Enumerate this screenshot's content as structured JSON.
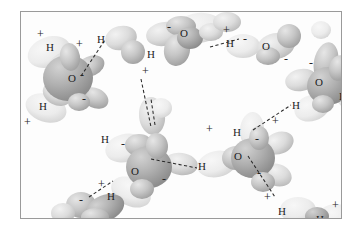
{
  "figure": {
    "kind": "molecular-illustration",
    "background_color": "#ffffff",
    "panel_color": "#fdfdfd",
    "frame_color": "#9a9a9a",
    "lobe_fill_light": "#e3e3e3",
    "lobe_fill_mid": "#c9c9c9",
    "lobe_fill_dark": "#a9a9a9",
    "label_color": "#1d1d1d",
    "bond_color": "#2b2b2b"
  },
  "labels": {
    "atoms": [
      {
        "text": "H",
        "x": 45,
        "y": 41
      },
      {
        "text": "H",
        "x": 96,
        "y": 33
      },
      {
        "text": "O",
        "x": 67,
        "y": 72
      },
      {
        "text": "H",
        "x": 38,
        "y": 100
      },
      {
        "text": "O",
        "x": 179,
        "y": 27
      },
      {
        "text": "H",
        "x": 146,
        "y": 48
      },
      {
        "text": "H",
        "x": 225,
        "y": 37
      },
      {
        "text": "O",
        "x": 261,
        "y": 40
      },
      {
        "text": "O",
        "x": 314,
        "y": 76
      },
      {
        "text": "H",
        "x": 338,
        "y": 90
      },
      {
        "text": "H",
        "x": 291,
        "y": 99
      },
      {
        "text": "H",
        "x": 100,
        "y": 133
      },
      {
        "text": "O",
        "x": 130,
        "y": 165
      },
      {
        "text": "H",
        "x": 232,
        "y": 126
      },
      {
        "text": "O",
        "x": 233,
        "y": 150
      },
      {
        "text": "H",
        "x": 197,
        "y": 160
      },
      {
        "text": "H",
        "x": 106,
        "y": 190
      },
      {
        "text": "H",
        "x": 277,
        "y": 205
      },
      {
        "text": "H",
        "x": 315,
        "y": 213
      }
    ],
    "charges": [
      {
        "sign": "+",
        "x": 36,
        "y": 27
      },
      {
        "sign": "+",
        "x": 75,
        "y": 37
      },
      {
        "sign": "-",
        "x": 79,
        "y": 68
      },
      {
        "sign": "-",
        "x": 81,
        "y": 92
      },
      {
        "sign": "+",
        "x": 23,
        "y": 115
      },
      {
        "sign": "-",
        "x": 166,
        "y": 20
      },
      {
        "sign": "+",
        "x": 141,
        "y": 64
      },
      {
        "sign": "+",
        "x": 222,
        "y": 23
      },
      {
        "sign": "-",
        "x": 242,
        "y": 32
      },
      {
        "sign": "-",
        "x": 283,
        "y": 52
      },
      {
        "sign": "-",
        "x": 308,
        "y": 56
      },
      {
        "sign": "+",
        "x": 271,
        "y": 114
      },
      {
        "sign": "-",
        "x": 120,
        "y": 137
      },
      {
        "sign": "-",
        "x": 161,
        "y": 172
      },
      {
        "sign": "+",
        "x": 205,
        "y": 122
      },
      {
        "sign": "-",
        "x": 254,
        "y": 132
      },
      {
        "sign": "-",
        "x": 256,
        "y": 166
      },
      {
        "sign": "+",
        "x": 263,
        "y": 190
      },
      {
        "sign": "+",
        "x": 97,
        "y": 177
      },
      {
        "sign": "-",
        "x": 78,
        "y": 193
      },
      {
        "sign": "+",
        "x": 331,
        "y": 198
      }
    ]
  },
  "hydrogen_bonds": [
    {
      "x1": 80,
      "y1": 75,
      "x2": 104,
      "y2": 39
    },
    {
      "x1": 209,
      "y1": 46,
      "x2": 238,
      "y2": 38
    },
    {
      "x1": 140,
      "y1": 78,
      "x2": 150,
      "y2": 126
    },
    {
      "x1": 150,
      "y1": 158,
      "x2": 196,
      "y2": 167
    },
    {
      "x1": 247,
      "y1": 155,
      "x2": 274,
      "y2": 196
    },
    {
      "x1": 88,
      "y1": 196,
      "x2": 112,
      "y2": 180
    },
    {
      "x1": 252,
      "y1": 129,
      "x2": 290,
      "y2": 104
    },
    {
      "x1": 154,
      "y1": 124,
      "x2": 150,
      "y2": 98
    }
  ]
}
